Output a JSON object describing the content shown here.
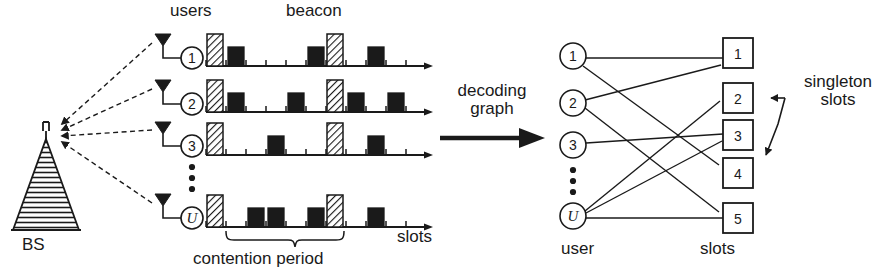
{
  "figure": {
    "colors": {
      "ink": "#1a1a1a",
      "packet_fill": "#1a1a1a",
      "beacon_hatch": "#1a1a1a",
      "background": "#ffffff"
    }
  },
  "left_panel": {
    "label_users": "users",
    "label_beacon": "beacon",
    "label_bs": "BS",
    "label_slots": "slots",
    "label_contention": "contention period",
    "bs_icon": "base-station-antenna-icon",
    "user_icon": "user-antenna-icon",
    "users": [
      {
        "id": "1",
        "label": "1",
        "italic": false
      },
      {
        "id": "2",
        "label": "2",
        "italic": false
      },
      {
        "id": "3",
        "label": "3",
        "italic": false
      },
      {
        "id": "U",
        "label": "U",
        "italic": true
      }
    ],
    "vertical_dots": "⋮",
    "timeline": {
      "n_slots": 11,
      "beacon_slots": [
        0,
        6
      ],
      "rows": [
        {
          "user": "1",
          "packet_slots": [
            1,
            5,
            8
          ]
        },
        {
          "user": "2",
          "packet_slots": [
            1,
            4,
            7,
            9
          ]
        },
        {
          "user": "3",
          "packet_slots": [
            3,
            8
          ]
        },
        {
          "user": "U",
          "packet_slots": [
            2,
            3,
            5,
            8
          ]
        }
      ],
      "contention_brace_from_slot": 1,
      "contention_brace_to_slot": 6
    }
  },
  "transition": {
    "label_line1": "decoding",
    "label_line2": "graph",
    "arrow_icon": "right-arrow-icon"
  },
  "right_panel": {
    "label_user": "user",
    "label_slots": "slots",
    "label_singleton": "singleton slots",
    "singleton_arrow_icon": "callout-arrow-icon",
    "vertical_dots": "⋮",
    "user_nodes": [
      {
        "id": "1",
        "label": "1",
        "italic": false
      },
      {
        "id": "2",
        "label": "2",
        "italic": false
      },
      {
        "id": "3",
        "label": "3",
        "italic": false
      },
      {
        "id": "U",
        "label": "U",
        "italic": true
      }
    ],
    "slot_nodes": [
      {
        "id": "1",
        "label": "1"
      },
      {
        "id": "2",
        "label": "2"
      },
      {
        "id": "3",
        "label": "3"
      },
      {
        "id": "4",
        "label": "4"
      },
      {
        "id": "5",
        "label": "5"
      }
    ],
    "edges": [
      {
        "user": "1",
        "slot": "1"
      },
      {
        "user": "1",
        "slot": "4"
      },
      {
        "user": "2",
        "slot": "1"
      },
      {
        "user": "2",
        "slot": "5"
      },
      {
        "user": "3",
        "slot": "3"
      },
      {
        "user": "U",
        "slot": "2"
      },
      {
        "user": "U",
        "slot": "3"
      },
      {
        "user": "U",
        "slot": "5"
      }
    ],
    "singleton_slots": [
      "2",
      "4"
    ]
  }
}
